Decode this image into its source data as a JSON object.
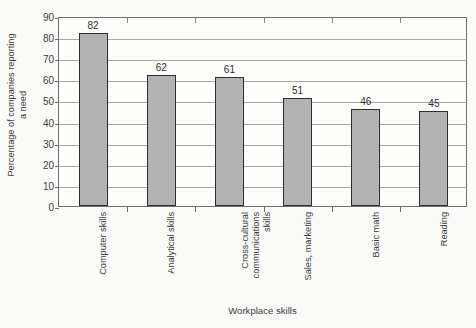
{
  "chart_data": {
    "type": "bar",
    "title": "",
    "xlabel": "Workplace skills",
    "ylabel_line1": "Percentage of companies reporting",
    "ylabel_line2": "a need",
    "categories": [
      "Computer skills",
      "Analytical skills",
      "Cross-cultural communications skills",
      "Sales, marketing",
      "Basic math",
      "Reading"
    ],
    "category_lines": [
      [
        "Computer skills"
      ],
      [
        "Analytical skills"
      ],
      [
        "Cross-cultural",
        "communications",
        "skills"
      ],
      [
        "Sales, marketing"
      ],
      [
        "Basic math"
      ],
      [
        "Reading"
      ]
    ],
    "values": [
      82,
      62,
      61,
      51,
      46,
      45
    ],
    "value_labels": [
      "82",
      "62",
      "61",
      "51",
      "46",
      "45"
    ],
    "ylim": [
      0,
      90
    ],
    "ytick_step": 10,
    "ytick_labels": [
      "0",
      "10",
      "20",
      "30",
      "40",
      "50",
      "60",
      "70",
      "80",
      "90"
    ],
    "grid": true,
    "legend": "none",
    "bar_color": "#b2b2b2",
    "bar_border_color": "#2e2e2e",
    "grid_color": "#a9a9a9",
    "axis_color": "#6e6e6e",
    "text_color": "#3b3b3b",
    "background_color": "#fbfbf9"
  }
}
